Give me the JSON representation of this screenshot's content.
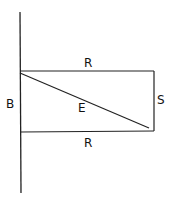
{
  "diagram": {
    "labels": {
      "top": "R",
      "bottom": "R",
      "left": "B",
      "right": "S",
      "diagonal": "E"
    },
    "stroke_color": "#222222",
    "background": "#ffffff"
  }
}
